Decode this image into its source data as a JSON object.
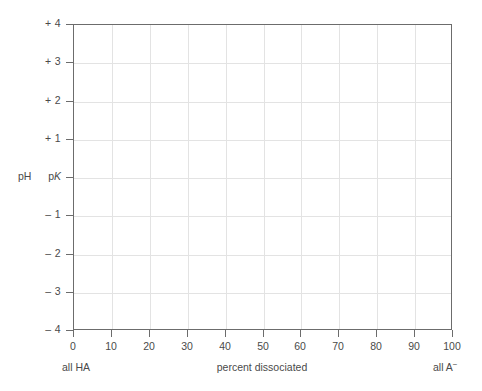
{
  "chart_data": {
    "type": "line",
    "title": "",
    "subtitle": "",
    "xlabel": "percent dissociated",
    "ylabel": "pH",
    "xlim": [
      0,
      100
    ],
    "ylim": [
      -4,
      4
    ],
    "grid": true,
    "legend": null,
    "series": [],
    "x_ticks": [
      0,
      10,
      20,
      30,
      40,
      50,
      60,
      70,
      80,
      90,
      100
    ],
    "x_tick_labels": [
      "0",
      "10",
      "20",
      "30",
      "40",
      "50",
      "60",
      "70",
      "80",
      "90",
      "100"
    ],
    "y_ticks": [
      4,
      3,
      2,
      1,
      0,
      -1,
      -2,
      -3,
      -4
    ],
    "y_tick_labels": [
      "+ 4",
      "+ 3",
      "+ 2",
      "+ 1",
      "pK",
      "– 1",
      "– 2",
      "– 3",
      "– 4"
    ],
    "annotations": [
      {
        "text": "all HA",
        "position": "below-axis-left",
        "x": 0
      },
      {
        "text": "percent dissociated",
        "position": "below-axis-center",
        "x": 50
      },
      {
        "text": "all A⁻",
        "position": "below-axis-right",
        "x": 100
      }
    ]
  },
  "axes": {
    "y_axis_title": "pH",
    "x_axis_title": "percent dissociated",
    "y_tick_labels": [
      {
        "value": 4,
        "text": "+ 4",
        "pk": false
      },
      {
        "value": 3,
        "text": "+ 3",
        "pk": false
      },
      {
        "value": 2,
        "text": "+ 2",
        "pk": false
      },
      {
        "value": 1,
        "text": "+ 1",
        "pk": false
      },
      {
        "value": 0,
        "text": "pK",
        "pk": true
      },
      {
        "value": -1,
        "text": "– 1",
        "pk": false
      },
      {
        "value": -2,
        "text": "– 2",
        "pk": false
      },
      {
        "value": -3,
        "text": "– 3",
        "pk": false
      },
      {
        "value": -4,
        "text": "– 4",
        "pk": false
      }
    ],
    "x_tick_labels": [
      {
        "value": 0,
        "text": "0"
      },
      {
        "value": 10,
        "text": "10"
      },
      {
        "value": 20,
        "text": "20"
      },
      {
        "value": 30,
        "text": "30"
      },
      {
        "value": 40,
        "text": "40"
      },
      {
        "value": 50,
        "text": "50"
      },
      {
        "value": 60,
        "text": "60"
      },
      {
        "value": 70,
        "text": "70"
      },
      {
        "value": 80,
        "text": "80"
      },
      {
        "value": 90,
        "text": "90"
      },
      {
        "value": 100,
        "text": "100"
      }
    ]
  },
  "annotations": {
    "left_end": "all HA",
    "right_end_base": "all A",
    "right_end_charge": "−"
  },
  "colors": {
    "background": "#ffffff",
    "axis_line": "#6c6c6c",
    "grid_line": "#e3e3e3",
    "text": "#4a4a4a"
  }
}
